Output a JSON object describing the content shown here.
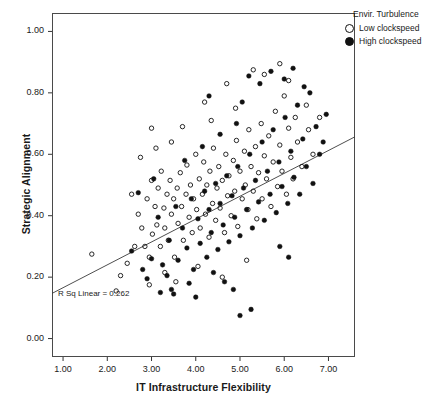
{
  "chart_data": {
    "type": "scatter",
    "title": "",
    "xlabel": "IT Infrastructure Flexibility",
    "ylabel": "Strategic Alignment",
    "xlim": [
      0.75,
      7.6
    ],
    "ylim": [
      -0.06,
      1.06
    ],
    "xticks": [
      1.0,
      2.0,
      3.0,
      4.0,
      5.0,
      6.0,
      7.0
    ],
    "xticklabels": [
      "1.00",
      "2.00",
      "3.00",
      "4.00",
      "5.00",
      "6.00",
      "7.00"
    ],
    "yticks": [
      0.0,
      0.2,
      0.4,
      0.6,
      0.8,
      1.0
    ],
    "yticklabels": [
      "0.00",
      "0.20",
      "0.40",
      "0.60",
      "0.80",
      "1.00"
    ],
    "grid": false,
    "legend_position": "top-right",
    "legend": {
      "title": "Envir. Turbulence",
      "entries": [
        {
          "label": "Low clockspeed",
          "marker": "open-circle",
          "color": "#111111"
        },
        {
          "label": "High clockspeed",
          "marker": "filled-circle",
          "color": "#111111"
        }
      ]
    },
    "annotations": [
      {
        "text": "R Sq Linear = 0.262",
        "x": 1.15,
        "y": 0.175
      }
    ],
    "fit_line": {
      "type": "linear",
      "r_squared": 0.262,
      "x_start": 0.75,
      "y_start": 0.147,
      "x_end": 7.6,
      "y_end": 0.657
    },
    "series": [
      {
        "name": "Low clockspeed",
        "marker": "open-circle",
        "points": [
          [
            1.65,
            0.275
          ],
          [
            2.3,
            0.205
          ],
          [
            2.45,
            0.245
          ],
          [
            2.55,
            0.47
          ],
          [
            2.62,
            0.3
          ],
          [
            2.7,
            0.405
          ],
          [
            2.78,
            0.36
          ],
          [
            2.85,
            0.3
          ],
          [
            2.9,
            0.455
          ],
          [
            2.95,
            0.265
          ],
          [
            3.0,
            0.515
          ],
          [
            3.02,
            0.34
          ],
          [
            3.08,
            0.43
          ],
          [
            3.12,
            0.37
          ],
          [
            3.15,
            0.49
          ],
          [
            3.2,
            0.3
          ],
          [
            3.22,
            0.545
          ],
          [
            3.28,
            0.425
          ],
          [
            3.3,
            0.36
          ],
          [
            3.35,
            0.47
          ],
          [
            3.38,
            0.32
          ],
          [
            3.42,
            0.515
          ],
          [
            3.45,
            0.405
          ],
          [
            3.5,
            0.455
          ],
          [
            3.52,
            0.265
          ],
          [
            3.58,
            0.49
          ],
          [
            3.6,
            0.375
          ],
          [
            3.65,
            0.54
          ],
          [
            3.68,
            0.43
          ],
          [
            3.72,
            0.32
          ],
          [
            3.78,
            0.47
          ],
          [
            3.8,
            0.565
          ],
          [
            3.85,
            0.395
          ],
          [
            3.88,
            0.5
          ],
          [
            3.92,
            0.345
          ],
          [
            3.95,
            0.455
          ],
          [
            4.0,
            0.6
          ],
          [
            4.02,
            0.42
          ],
          [
            4.08,
            0.52
          ],
          [
            4.1,
            0.36
          ],
          [
            4.15,
            0.47
          ],
          [
            4.18,
            0.575
          ],
          [
            4.22,
            0.405
          ],
          [
            4.25,
            0.5
          ],
          [
            4.3,
            0.33
          ],
          [
            4.32,
            0.545
          ],
          [
            4.38,
            0.44
          ],
          [
            4.4,
            0.62
          ],
          [
            4.45,
            0.385
          ],
          [
            4.48,
            0.49
          ],
          [
            4.52,
            0.56
          ],
          [
            4.55,
            0.425
          ],
          [
            4.6,
            0.515
          ],
          [
            4.65,
            0.345
          ],
          [
            4.68,
            0.6
          ],
          [
            4.72,
            0.465
          ],
          [
            4.75,
            0.53
          ],
          [
            4.8,
            0.4
          ],
          [
            4.85,
            0.58
          ],
          [
            4.88,
            0.48
          ],
          [
            4.92,
            0.645
          ],
          [
            4.95,
            0.365
          ],
          [
            5.0,
            0.545
          ],
          [
            5.05,
            0.455
          ],
          [
            5.1,
            0.61
          ],
          [
            5.12,
            0.5
          ],
          [
            5.18,
            0.42
          ],
          [
            5.2,
            0.68
          ],
          [
            5.25,
            0.56
          ],
          [
            5.3,
            0.48
          ],
          [
            5.35,
            0.625
          ],
          [
            5.38,
            0.39
          ],
          [
            5.42,
            0.54
          ],
          [
            5.48,
            0.7
          ],
          [
            5.5,
            0.455
          ],
          [
            5.55,
            0.595
          ],
          [
            5.6,
            0.52
          ],
          [
            5.65,
            0.66
          ],
          [
            5.7,
            0.43
          ],
          [
            5.75,
            0.575
          ],
          [
            5.8,
            0.74
          ],
          [
            5.85,
            0.495
          ],
          [
            5.9,
            0.63
          ],
          [
            5.95,
            0.545
          ],
          [
            6.0,
            0.79
          ],
          [
            6.05,
            0.47
          ],
          [
            6.1,
            0.685
          ],
          [
            6.15,
            0.59
          ],
          [
            6.2,
            0.52
          ],
          [
            6.25,
            0.72
          ],
          [
            6.3,
            0.64
          ],
          [
            6.4,
            0.56
          ],
          [
            6.5,
            0.76
          ],
          [
            6.55,
            0.68
          ],
          [
            6.65,
            0.6
          ],
          [
            6.8,
            0.72
          ],
          [
            2.2,
            0.155
          ],
          [
            2.95,
            0.175
          ],
          [
            3.3,
            0.215
          ],
          [
            3.55,
            0.185
          ],
          [
            4.05,
            0.235
          ],
          [
            4.6,
            0.2
          ],
          [
            5.15,
            0.255
          ],
          [
            3.0,
            0.685
          ],
          [
            3.45,
            0.64
          ],
          [
            4.2,
            0.77
          ],
          [
            4.7,
            0.83
          ],
          [
            5.3,
            0.875
          ],
          [
            5.55,
            0.86
          ],
          [
            5.9,
            0.895
          ],
          [
            6.1,
            0.84
          ],
          [
            2.75,
            0.59
          ],
          [
            3.1,
            0.62
          ],
          [
            3.7,
            0.69
          ],
          [
            4.35,
            0.71
          ],
          [
            4.9,
            0.75
          ]
        ]
      },
      {
        "name": "High clockspeed",
        "marker": "filled-circle",
        "points": [
          [
            2.55,
            0.285
          ],
          [
            2.8,
            0.225
          ],
          [
            3.0,
            0.26
          ],
          [
            3.15,
            0.395
          ],
          [
            3.25,
            0.24
          ],
          [
            3.4,
            0.32
          ],
          [
            3.55,
            0.43
          ],
          [
            3.6,
            0.255
          ],
          [
            3.7,
            0.36
          ],
          [
            3.8,
            0.295
          ],
          [
            3.9,
            0.455
          ],
          [
            3.95,
            0.225
          ],
          [
            4.05,
            0.39
          ],
          [
            4.1,
            0.31
          ],
          [
            4.2,
            0.48
          ],
          [
            4.25,
            0.265
          ],
          [
            4.3,
            0.42
          ],
          [
            4.35,
            0.345
          ],
          [
            4.45,
            0.505
          ],
          [
            4.5,
            0.29
          ],
          [
            4.55,
            0.44
          ],
          [
            4.62,
            0.37
          ],
          [
            4.7,
            0.53
          ],
          [
            4.75,
            0.315
          ],
          [
            4.82,
            0.465
          ],
          [
            4.88,
            0.395
          ],
          [
            4.95,
            0.56
          ],
          [
            5.0,
            0.335
          ],
          [
            5.08,
            0.49
          ],
          [
            5.15,
            0.42
          ],
          [
            5.22,
            0.6
          ],
          [
            5.28,
            0.36
          ],
          [
            5.35,
            0.515
          ],
          [
            5.42,
            0.445
          ],
          [
            5.5,
            0.64
          ],
          [
            5.55,
            0.385
          ],
          [
            5.62,
            0.545
          ],
          [
            5.68,
            0.47
          ],
          [
            5.75,
            0.68
          ],
          [
            5.82,
            0.41
          ],
          [
            5.88,
            0.575
          ],
          [
            5.95,
            0.495
          ],
          [
            6.02,
            0.72
          ],
          [
            6.08,
            0.44
          ],
          [
            6.15,
            0.61
          ],
          [
            6.22,
            0.525
          ],
          [
            6.3,
            0.76
          ],
          [
            6.35,
            0.47
          ],
          [
            6.42,
            0.65
          ],
          [
            6.5,
            0.56
          ],
          [
            6.58,
            0.8
          ],
          [
            6.65,
            0.505
          ],
          [
            6.72,
            0.69
          ],
          [
            6.8,
            0.6
          ],
          [
            6.88,
            0.64
          ],
          [
            6.95,
            0.73
          ],
          [
            5.2,
            0.855
          ],
          [
            5.45,
            0.83
          ],
          [
            5.7,
            0.87
          ],
          [
            6.0,
            0.845
          ],
          [
            6.2,
            0.88
          ],
          [
            6.45,
            0.82
          ],
          [
            3.2,
            0.15
          ],
          [
            3.45,
            0.16
          ],
          [
            3.5,
            0.145
          ],
          [
            4.0,
            0.135
          ],
          [
            4.85,
            0.16
          ],
          [
            5.25,
            0.095
          ],
          [
            5.0,
            0.075
          ],
          [
            2.9,
            0.195
          ],
          [
            3.35,
            0.205
          ],
          [
            3.85,
            0.18
          ],
          [
            4.4,
            0.215
          ],
          [
            4.65,
            0.185
          ],
          [
            5.9,
            0.3
          ],
          [
            6.1,
            0.265
          ],
          [
            2.7,
            0.475
          ],
          [
            3.05,
            0.52
          ],
          [
            3.75,
            0.58
          ],
          [
            4.15,
            0.625
          ],
          [
            4.55,
            0.665
          ],
          [
            4.92,
            0.7
          ],
          [
            5.05,
            0.77
          ],
          [
            4.3,
            0.79
          ]
        ]
      }
    ]
  }
}
